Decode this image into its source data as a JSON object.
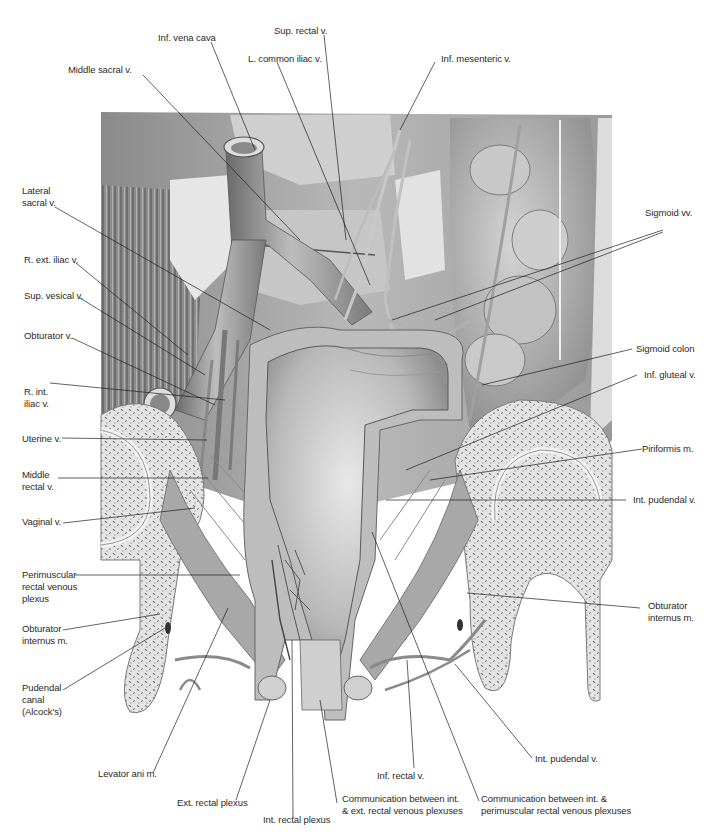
{
  "figure": {
    "type": "anatomical-illustration",
    "colors": {
      "background": "#ffffff",
      "label_text": "#2a2a2a",
      "leader_line": "#1e1e1e",
      "tissue_dark": "#5a5a5a",
      "tissue_mid": "#9a9a9a",
      "tissue_light": "#d8d8d8",
      "bone_fill": "#e6e6e6",
      "bone_speckle": "#6e6e6e"
    }
  },
  "labels": {
    "top": [
      {
        "id": "inf-vena-cava",
        "text": "Inf. vena cava"
      },
      {
        "id": "sup-rectal-v",
        "text": "Sup. rectal v."
      },
      {
        "id": "l-common-iliac-v",
        "text": "L. common iliac v."
      },
      {
        "id": "middle-sacral-v",
        "text": "Middle sacral v."
      },
      {
        "id": "inf-mesenteric-v",
        "text": "Inf. mesenteric v."
      }
    ],
    "left": [
      {
        "id": "lateral-sacral-v",
        "text": "Lateral\nsacral v."
      },
      {
        "id": "r-ext-iliac-v",
        "text": "R. ext. iliac v."
      },
      {
        "id": "sup-vesical-v",
        "text": "Sup. vesical v."
      },
      {
        "id": "obturator-v",
        "text": "Obturator v."
      },
      {
        "id": "r-int-iliac-v",
        "text": "R. int.\niliac v."
      },
      {
        "id": "uterine-v",
        "text": "Uterine v."
      },
      {
        "id": "middle-rectal-v",
        "text": "Middle\nrectal v."
      },
      {
        "id": "vaginal-v",
        "text": "Vaginal v."
      },
      {
        "id": "perimuscular-plexus",
        "text": "Perimuscular\nrectal venous\nplexus"
      },
      {
        "id": "obturator-internus-m-left",
        "text": "Obturator\ninternus m."
      },
      {
        "id": "pudendal-canal",
        "text": "Pudendal\ncanal\n(Alcock's)"
      }
    ],
    "right": [
      {
        "id": "sigmoid-vv",
        "text": "Sigmoid vv."
      },
      {
        "id": "sigmoid-colon",
        "text": "Sigmoid colon"
      },
      {
        "id": "inf-gluteal-v",
        "text": "Inf. gluteal v."
      },
      {
        "id": "piriformis-m",
        "text": "Piriformis m."
      },
      {
        "id": "int-pudendal-v-right",
        "text": "Int. pudendal v."
      },
      {
        "id": "obturator-internus-m-right",
        "text": "Obturator\ninternus m."
      }
    ],
    "bottom": [
      {
        "id": "levator-ani-m",
        "text": "Levator ani m."
      },
      {
        "id": "ext-rectal-plexus",
        "text": "Ext. rectal plexus"
      },
      {
        "id": "int-rectal-plexus",
        "text": "Int. rectal plexus"
      },
      {
        "id": "comm-int-ext",
        "text": "Communication between int.\n& ext. rectal venous plexuses"
      },
      {
        "id": "inf-rectal-v",
        "text": "Inf. rectal v."
      },
      {
        "id": "comm-int-perimuscular",
        "text": "Communication between int. &\nperimuscular rectal venous plexuses"
      },
      {
        "id": "int-pudendal-v-bottom",
        "text": "Int. pudendal v."
      }
    ]
  }
}
